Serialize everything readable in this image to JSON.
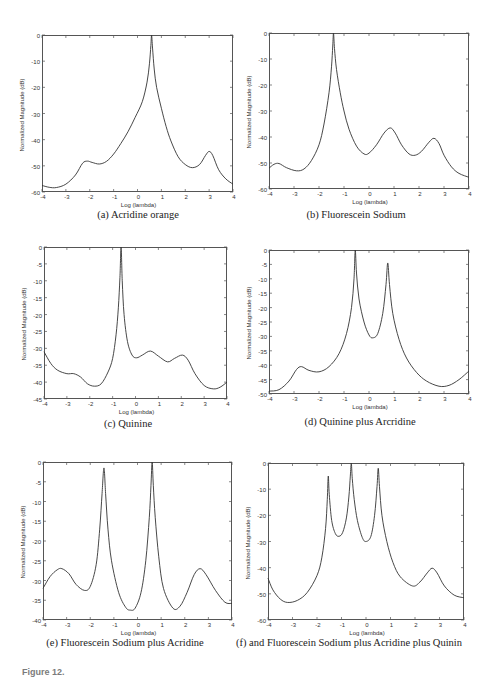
{
  "figure": {
    "captions": {
      "a": "(a) Acridine orange",
      "b": "(b) Fluorescein Sodium",
      "c": "(c) Quinine",
      "d": "(d) Quinine plus Arcridine",
      "e": "(e) Fluorescein Sodium plus Acridine",
      "f": "(f) and Fluorescein Sodium plus Acridine plus Quinin"
    },
    "figure_caption_label": "Figure 12."
  },
  "chart_data": [
    {
      "id": "a",
      "type": "line",
      "title": "(a) Acridine orange",
      "xlabel": "Log (lambda)",
      "ylabel": "Normalized Magnitude (dB)",
      "xlim": [
        -4,
        4
      ],
      "ylim": [
        -60,
        0
      ],
      "xticks": [
        -4,
        -3,
        -2,
        -1,
        0,
        1,
        2,
        3,
        4
      ],
      "yticks": [
        0,
        -10,
        -20,
        -30,
        -40,
        -50,
        -60
      ],
      "grid": false,
      "line_color": "#333333",
      "points": [
        [
          -4,
          -57.5
        ],
        [
          -3.7,
          -58.2
        ],
        [
          -3.4,
          -58.3
        ],
        [
          -3.0,
          -57
        ],
        [
          -2.6,
          -53.5
        ],
        [
          -2.3,
          -49
        ],
        [
          -2.1,
          -48.2
        ],
        [
          -1.9,
          -48.7
        ],
        [
          -1.6,
          -49.3
        ],
        [
          -1.3,
          -48.3
        ],
        [
          -1.0,
          -45.5
        ],
        [
          -0.7,
          -41.5
        ],
        [
          -0.4,
          -37
        ],
        [
          -0.1,
          -31.5
        ],
        [
          0.2,
          -25.5
        ],
        [
          0.4,
          -18
        ],
        [
          0.5,
          -11
        ],
        [
          0.56,
          -4
        ],
        [
          0.59,
          0
        ],
        [
          0.63,
          -5
        ],
        [
          0.7,
          -13
        ],
        [
          0.8,
          -20
        ],
        [
          1.0,
          -28
        ],
        [
          1.2,
          -35
        ],
        [
          1.4,
          -40.5
        ],
        [
          1.7,
          -46.5
        ],
        [
          2.0,
          -49.5
        ],
        [
          2.3,
          -50.7
        ],
        [
          2.6,
          -49.5
        ],
        [
          2.85,
          -46
        ],
        [
          3.0,
          -44.5
        ],
        [
          3.15,
          -46
        ],
        [
          3.4,
          -51.5
        ],
        [
          3.7,
          -55
        ],
        [
          4,
          -57
        ]
      ]
    },
    {
      "id": "b",
      "type": "line",
      "title": "(b) Fluorescein Sodium",
      "xlabel": "Log (lambda)",
      "ylabel": "Normalized Magnitude (dB)",
      "xlim": [
        -4,
        4
      ],
      "ylim": [
        -60,
        0
      ],
      "xticks": [
        -4,
        -3,
        -2,
        -1,
        0,
        1,
        2,
        3,
        4
      ],
      "yticks": [
        0,
        -10,
        -20,
        -30,
        -40,
        -50,
        -60
      ],
      "grid": false,
      "line_color": "#333333",
      "points": [
        [
          -4,
          -52
        ],
        [
          -3.8,
          -50.5
        ],
        [
          -3.6,
          -50.2
        ],
        [
          -3.3,
          -51.8
        ],
        [
          -2.9,
          -53
        ],
        [
          -2.6,
          -52.3
        ],
        [
          -2.3,
          -49
        ],
        [
          -2.0,
          -43
        ],
        [
          -1.8,
          -35
        ],
        [
          -1.6,
          -23
        ],
        [
          -1.5,
          -13
        ],
        [
          -1.45,
          -5
        ],
        [
          -1.42,
          0
        ],
        [
          -1.38,
          -6
        ],
        [
          -1.3,
          -14
        ],
        [
          -1.15,
          -23
        ],
        [
          -1.0,
          -30
        ],
        [
          -0.8,
          -37
        ],
        [
          -0.5,
          -43.5
        ],
        [
          -0.2,
          -46.5
        ],
        [
          0.0,
          -46.2
        ],
        [
          0.3,
          -43
        ],
        [
          0.6,
          -38.5
        ],
        [
          0.85,
          -36.5
        ],
        [
          1.05,
          -38.5
        ],
        [
          1.3,
          -43
        ],
        [
          1.6,
          -46.5
        ],
        [
          1.85,
          -47
        ],
        [
          2.1,
          -45.5
        ],
        [
          2.4,
          -42
        ],
        [
          2.6,
          -40.5
        ],
        [
          2.8,
          -42.5
        ],
        [
          3.0,
          -47
        ],
        [
          3.3,
          -51.5
        ],
        [
          3.6,
          -54
        ],
        [
          4,
          -55.5
        ]
      ]
    },
    {
      "id": "c",
      "type": "line",
      "title": "(c) Quinine",
      "xlabel": "Log (lambda)",
      "ylabel": "Normalized Magnitude (dB)",
      "xlim": [
        -4,
        4
      ],
      "ylim": [
        -45,
        0
      ],
      "xticks": [
        -4,
        -3,
        -2,
        -1,
        0,
        1,
        2,
        3,
        4
      ],
      "yticks": [
        0,
        -5,
        -10,
        -15,
        -20,
        -25,
        -30,
        -35,
        -40,
        -45
      ],
      "grid": false,
      "line_color": "#333333",
      "points": [
        [
          -4,
          -31
        ],
        [
          -3.7,
          -34.5
        ],
        [
          -3.4,
          -36.5
        ],
        [
          -3.0,
          -37.5
        ],
        [
          -2.7,
          -37.5
        ],
        [
          -2.4,
          -38.5
        ],
        [
          -2.1,
          -40.5
        ],
        [
          -1.8,
          -41.2
        ],
        [
          -1.5,
          -40.5
        ],
        [
          -1.2,
          -37
        ],
        [
          -1.0,
          -33
        ],
        [
          -0.85,
          -26
        ],
        [
          -0.75,
          -18
        ],
        [
          -0.68,
          -9
        ],
        [
          -0.63,
          0
        ],
        [
          -0.58,
          -10
        ],
        [
          -0.5,
          -20
        ],
        [
          -0.35,
          -28
        ],
        [
          -0.15,
          -32
        ],
        [
          0.05,
          -32.8
        ],
        [
          0.3,
          -32
        ],
        [
          0.65,
          -30.8
        ],
        [
          1.0,
          -32.3
        ],
        [
          1.4,
          -34
        ],
        [
          1.7,
          -33
        ],
        [
          2.05,
          -32
        ],
        [
          2.3,
          -33.5
        ],
        [
          2.6,
          -37.5
        ],
        [
          3.0,
          -41
        ],
        [
          3.4,
          -42
        ],
        [
          3.7,
          -41.5
        ],
        [
          4,
          -40
        ]
      ]
    },
    {
      "id": "d",
      "type": "line",
      "title": "(d) Quinine plus Arcridine",
      "xlabel": "Log (lambda)",
      "ylabel": "Normalized Magnitude (dB)",
      "xlim": [
        -4,
        4
      ],
      "ylim": [
        -50,
        0
      ],
      "xticks": [
        -4,
        -3,
        -2,
        -1,
        0,
        1,
        2,
        3,
        4
      ],
      "yticks": [
        0,
        -5,
        -10,
        -15,
        -20,
        -25,
        -30,
        -35,
        -40,
        -45,
        -50
      ],
      "grid": false,
      "line_color": "#333333",
      "points": [
        [
          -4,
          -49
        ],
        [
          -3.6,
          -48.5
        ],
        [
          -3.2,
          -45.5
        ],
        [
          -2.9,
          -41.5
        ],
        [
          -2.7,
          -40.5
        ],
        [
          -2.4,
          -41.8
        ],
        [
          -2.0,
          -42.3
        ],
        [
          -1.6,
          -40.5
        ],
        [
          -1.2,
          -36
        ],
        [
          -0.9,
          -29
        ],
        [
          -0.7,
          -20
        ],
        [
          -0.6,
          -10
        ],
        [
          -0.55,
          0
        ],
        [
          -0.5,
          -8
        ],
        [
          -0.4,
          -17
        ],
        [
          -0.2,
          -25
        ],
        [
          0.0,
          -29.5
        ],
        [
          0.15,
          -30.5
        ],
        [
          0.35,
          -29
        ],
        [
          0.55,
          -22
        ],
        [
          0.68,
          -12
        ],
        [
          0.75,
          -4.5
        ],
        [
          0.82,
          -12
        ],
        [
          0.95,
          -22
        ],
        [
          1.2,
          -31
        ],
        [
          1.5,
          -37.5
        ],
        [
          1.9,
          -42.5
        ],
        [
          2.3,
          -45.5
        ],
        [
          2.8,
          -47.3
        ],
        [
          3.2,
          -47
        ],
        [
          3.6,
          -45
        ],
        [
          4,
          -42
        ]
      ]
    },
    {
      "id": "e",
      "type": "line",
      "title": "(e) Fluorescein Sodium plus Acridine",
      "xlabel": "Log (lambda)",
      "ylabel": "Normalized Magnitude (dB)",
      "xlim": [
        -4,
        4
      ],
      "ylim": [
        -40,
        0
      ],
      "xticks": [
        -4,
        -3,
        -2,
        -1,
        0,
        1,
        2,
        3,
        4
      ],
      "yticks": [
        0,
        -5,
        -10,
        -15,
        -20,
        -25,
        -30,
        -35,
        -40
      ],
      "grid": false,
      "line_color": "#333333",
      "points": [
        [
          -4,
          -32
        ],
        [
          -3.7,
          -29
        ],
        [
          -3.4,
          -27.3
        ],
        [
          -3.2,
          -27
        ],
        [
          -2.9,
          -28.3
        ],
        [
          -2.6,
          -31
        ],
        [
          -2.25,
          -32.5
        ],
        [
          -2.0,
          -31.5
        ],
        [
          -1.75,
          -26
        ],
        [
          -1.6,
          -17
        ],
        [
          -1.5,
          -8
        ],
        [
          -1.42,
          -1.5
        ],
        [
          -1.35,
          -8
        ],
        [
          -1.25,
          -17
        ],
        [
          -1.1,
          -25
        ],
        [
          -0.8,
          -33
        ],
        [
          -0.5,
          -36.8
        ],
        [
          -0.3,
          -37.5
        ],
        [
          -0.1,
          -37
        ],
        [
          0.15,
          -33
        ],
        [
          0.35,
          -25
        ],
        [
          0.5,
          -14
        ],
        [
          0.57,
          -6
        ],
        [
          0.62,
          0
        ],
        [
          0.67,
          -6
        ],
        [
          0.75,
          -14
        ],
        [
          0.9,
          -24
        ],
        [
          1.1,
          -32
        ],
        [
          1.5,
          -37
        ],
        [
          1.8,
          -36.5
        ],
        [
          2.1,
          -33
        ],
        [
          2.4,
          -28.5
        ],
        [
          2.65,
          -27
        ],
        [
          2.9,
          -28.5
        ],
        [
          3.3,
          -32.5
        ],
        [
          3.7,
          -35.5
        ],
        [
          4,
          -35.8
        ]
      ]
    },
    {
      "id": "f",
      "type": "line",
      "title": "(f) and Fluorescein Sodium plus Acridine plus Quinin",
      "xlabel": "Log (lambda)",
      "ylabel": "Normalized Magnitude (dB)",
      "xlim": [
        -4,
        4
      ],
      "ylim": [
        -60,
        0
      ],
      "xticks": [
        -4,
        -3,
        -2,
        -1,
        0,
        1,
        2,
        3,
        4
      ],
      "yticks": [
        0,
        -10,
        -20,
        -30,
        -40,
        -50,
        -60
      ],
      "grid": false,
      "line_color": "#333333",
      "points": [
        [
          -4,
          -44
        ],
        [
          -3.8,
          -48.5
        ],
        [
          -3.5,
          -52
        ],
        [
          -3.2,
          -53.3
        ],
        [
          -2.8,
          -52.5
        ],
        [
          -2.4,
          -49.5
        ],
        [
          -2.0,
          -43
        ],
        [
          -1.8,
          -36
        ],
        [
          -1.65,
          -25
        ],
        [
          -1.58,
          -14
        ],
        [
          -1.54,
          -5
        ],
        [
          -1.5,
          -12
        ],
        [
          -1.4,
          -22
        ],
        [
          -1.25,
          -27
        ],
        [
          -1.1,
          -28
        ],
        [
          -0.95,
          -26.5
        ],
        [
          -0.8,
          -21
        ],
        [
          -0.7,
          -13
        ],
        [
          -0.64,
          -5
        ],
        [
          -0.6,
          0
        ],
        [
          -0.56,
          -6
        ],
        [
          -0.48,
          -14
        ],
        [
          -0.35,
          -22
        ],
        [
          -0.15,
          -28.5
        ],
        [
          0.0,
          -30
        ],
        [
          0.2,
          -28
        ],
        [
          0.35,
          -20
        ],
        [
          0.45,
          -9
        ],
        [
          0.5,
          -2
        ],
        [
          0.55,
          -9
        ],
        [
          0.65,
          -20
        ],
        [
          0.85,
          -30
        ],
        [
          1.1,
          -38
        ],
        [
          1.4,
          -43.5
        ],
        [
          1.9,
          -47
        ],
        [
          2.2,
          -45.5
        ],
        [
          2.5,
          -42
        ],
        [
          2.7,
          -40.2
        ],
        [
          2.9,
          -42
        ],
        [
          3.2,
          -47
        ],
        [
          3.6,
          -50.5
        ],
        [
          4,
          -51.5
        ]
      ]
    }
  ]
}
